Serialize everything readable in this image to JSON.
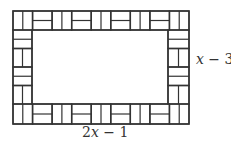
{
  "diagram": {
    "line_color": "#333333",
    "background_color": "#ffffff",
    "labels": {
      "height": "x − 3",
      "width": "2x − 1"
    },
    "top_border_pattern": [
      "double-vertical",
      "horizontal-stack",
      "double-vertical",
      "horizontal-stack",
      "double-vertical",
      "horizontal-stack",
      "double-vertical",
      "horizontal-stack",
      "double-vertical"
    ],
    "bottom_border_pattern": [
      "double-vertical",
      "horizontal-stack",
      "double-vertical",
      "horizontal-stack",
      "double-vertical",
      "horizontal-stack",
      "double-vertical",
      "horizontal-stack",
      "double-vertical"
    ],
    "left_border_pattern": [
      "horizontal-stack",
      "double-vertical",
      "horizontal-stack",
      "double-vertical"
    ],
    "right_border_pattern": [
      "horizontal-stack",
      "double-vertical",
      "horizontal-stack",
      "double-vertical"
    ]
  }
}
